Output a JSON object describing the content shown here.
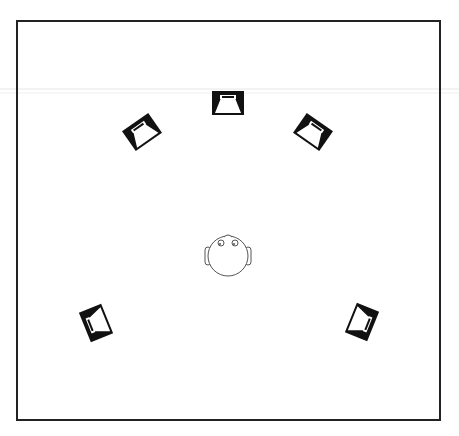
{
  "diagram": {
    "colors": {
      "background": "#ffffff",
      "frame": "#222222",
      "speaker_fill": "#111111",
      "speaker_cone": "#ffffff",
      "head_stroke": "#555555",
      "scan_line": "#e4e4e4"
    },
    "room": {
      "x": 17,
      "y": 21,
      "width": 423,
      "height": 399
    },
    "listener": {
      "cx": 228,
      "cy": 256,
      "r": 20,
      "label": "listener-head"
    },
    "speakers": [
      {
        "id": "center",
        "cx": 228,
        "cy": 103,
        "rotate": 0
      },
      {
        "id": "front-left",
        "cx": 142,
        "cy": 132,
        "rotate": -35
      },
      {
        "id": "front-right",
        "cx": 313,
        "cy": 132,
        "rotate": 35
      },
      {
        "id": "surround-left",
        "cx": 96,
        "cy": 323,
        "rotate": -112
      },
      {
        "id": "surround-right",
        "cx": 362,
        "cy": 322,
        "rotate": 112
      }
    ]
  }
}
